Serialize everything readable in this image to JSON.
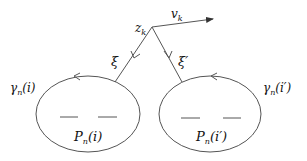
{
  "diagram": {
    "vertex_label": "z",
    "vertex_sub": "k",
    "vector_label": "v",
    "vector_sub": "k",
    "left_edge_label": "ξ",
    "right_edge_label": "ξ′",
    "left_contour": {
      "label": "γ",
      "sub": "n",
      "arg": "(i)"
    },
    "right_contour": {
      "label": "γ",
      "sub": "n",
      "arg": "(i′)"
    },
    "left_region": {
      "label": "P",
      "sub": "n",
      "arg": "(i)"
    },
    "right_region": {
      "label": "P",
      "sub": "n",
      "arg": "(i′)"
    },
    "colors": {
      "stroke": "#555555",
      "text": "#111111",
      "background": "#ffffff"
    }
  }
}
